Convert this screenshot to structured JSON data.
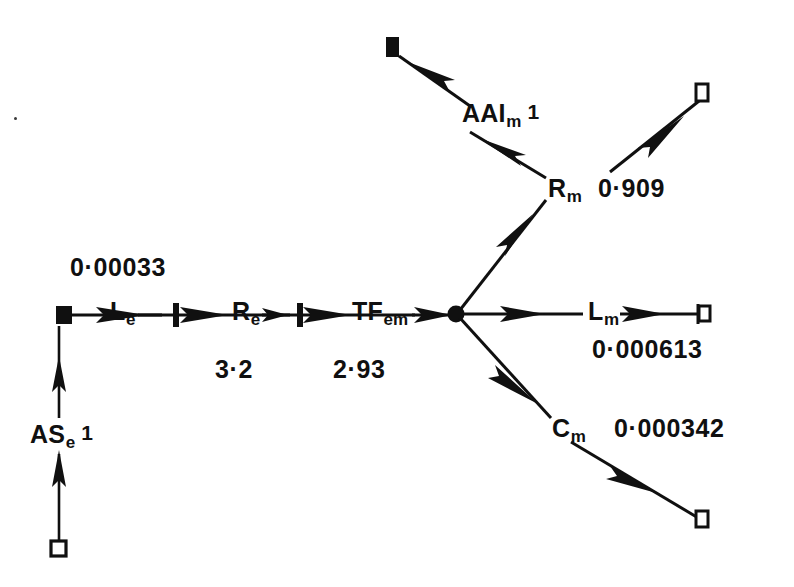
{
  "figure": {
    "type": "bond-graph",
    "title": "",
    "background_color": "#ffffff",
    "ink_color": "#101010"
  },
  "nodes": {
    "source_square_open_bottom_left": {
      "name": "open-square-terminal",
      "x": 58,
      "y": 548,
      "style": "hollow-square"
    },
    "source_square_filled": {
      "name": "filled-square-terminal",
      "x": 64,
      "y": 316,
      "style": "filled-square"
    },
    "sink_square_filled_top": {
      "name": "filled-square-terminal",
      "x": 392,
      "y": 47,
      "style": "filled-square"
    },
    "junction": {
      "name": "one-junction-node",
      "x": 456,
      "y": 313,
      "style": "filled-dot"
    },
    "open_square_top_right": {
      "name": "open-square-terminal",
      "x": 702,
      "y": 91,
      "style": "hollow-square"
    },
    "open_square_right": {
      "name": "open-square-terminal",
      "x": 705,
      "y": 312,
      "style": "hollow-square"
    },
    "open_square_bottom_right": {
      "name": "open-square-terminal",
      "x": 702,
      "y": 518,
      "style": "hollow-square"
    }
  },
  "element_labels": {
    "ase": {
      "text": "AS",
      "sub": "e",
      "sup": "1",
      "x": 30,
      "y": 438
    },
    "le": {
      "text": "L",
      "sub": "e",
      "sup": "",
      "x": 110,
      "y": 318
    },
    "re": {
      "text": "R",
      "sub": "e",
      "sup": "",
      "x": 232,
      "y": 318
    },
    "tfem": {
      "text": "TF",
      "sub": "em",
      "sup": "",
      "x": 352,
      "y": 318
    },
    "aalm": {
      "text": "AAI",
      "sub": "m",
      "sup": "1",
      "x": 462,
      "y": 117
    },
    "rm": {
      "text": "R",
      "sub": "m",
      "sup": "",
      "x": 548,
      "y": 192
    },
    "lm": {
      "text": "L",
      "sub": "m",
      "sup": "",
      "x": 590,
      "y": 318
    },
    "cm": {
      "text": "C",
      "sub": "m",
      "sup": "",
      "x": 552,
      "y": 432
    }
  },
  "value_labels": {
    "le_value": {
      "text": "0·00033",
      "x": 70,
      "y": 270
    },
    "re_value": {
      "text": "3·2",
      "x": 215,
      "y": 372
    },
    "tfem_value": {
      "text": "2·93",
      "x": 333,
      "y": 372
    },
    "rm_value": {
      "text": "0·909",
      "x": 598,
      "y": 192
    },
    "lm_value": {
      "text": "0·000613",
      "x": 592,
      "y": 352
    },
    "cm_value": {
      "text": "0·000342",
      "x": 612,
      "y": 432
    }
  },
  "bonds": [
    {
      "name": "bond-ase-lower",
      "from": "open-square-bottom-left",
      "to": "ase-mid",
      "direction": "up",
      "has_causal_stroke": false
    },
    {
      "name": "bond-ase-upper",
      "from": "ase-mid",
      "to": "filled-square",
      "direction": "up",
      "has_causal_stroke": false
    },
    {
      "name": "bond-filled-to-le",
      "from": "filled-square",
      "to": "Le",
      "direction": "right",
      "has_causal_stroke": false
    },
    {
      "name": "bond-le-to-re",
      "from": "Le",
      "to": "Re",
      "direction": "right",
      "has_causal_stroke": true
    },
    {
      "name": "bond-re-to-tfem",
      "from": "Re",
      "to": "TFem",
      "direction": "right",
      "has_causal_stroke": true
    },
    {
      "name": "bond-tfem-to-junction",
      "from": "TFem",
      "to": "junction",
      "direction": "right",
      "has_causal_stroke": false
    },
    {
      "name": "bond-junction-to-rm",
      "from": "junction",
      "to": "Rm",
      "direction": "up-right",
      "has_causal_stroke": false
    },
    {
      "name": "bond-rm-to-aalm",
      "from": "Rm",
      "to": "AAIm",
      "direction": "up-left",
      "has_causal_stroke": false
    },
    {
      "name": "bond-aalm-to-sink",
      "from": "AAIm",
      "to": "filled-square-top",
      "direction": "up-left",
      "has_causal_stroke": false
    },
    {
      "name": "bond-rm-to-open-square",
      "from": "Rm",
      "to": "open-square-top-right",
      "direction": "up-right",
      "has_causal_stroke": false
    },
    {
      "name": "bond-junction-to-lm",
      "from": "junction",
      "to": "Lm",
      "direction": "right",
      "has_causal_stroke": false
    },
    {
      "name": "bond-lm-to-open-square",
      "from": "Lm",
      "to": "open-square-right",
      "direction": "right",
      "has_causal_stroke": true
    },
    {
      "name": "bond-junction-to-cm",
      "from": "junction",
      "to": "Cm",
      "direction": "down-right",
      "has_causal_stroke": false
    },
    {
      "name": "bond-cm-to-open-square",
      "from": "Cm",
      "to": "open-square-bottom-right",
      "direction": "down-right",
      "has_causal_stroke": false
    }
  ]
}
